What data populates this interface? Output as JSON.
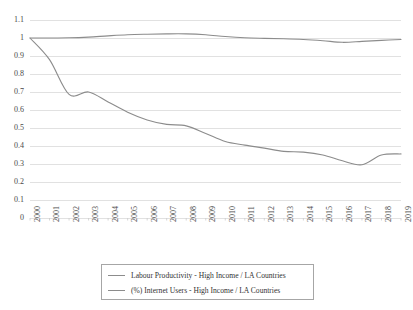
{
  "chart_data": {
    "type": "line",
    "title": "",
    "xlabel": "",
    "ylabel": "",
    "grid": "horizontal",
    "legend_position": "bottom",
    "ylim": [
      0,
      1.1
    ],
    "yticks": [
      "0",
      "0.1",
      "0.2",
      "0.3",
      "0.4",
      "0.5",
      "0.6",
      "0.7",
      "0.8",
      "0.9",
      "1",
      "1.1"
    ],
    "ytick_values": [
      0,
      0.1,
      0.2,
      0.3,
      0.4,
      0.5,
      0.6,
      0.7,
      0.8,
      0.9,
      1.0,
      1.1
    ],
    "x": [
      "2000",
      "2001",
      "2002",
      "2003",
      "2004",
      "2005",
      "2006",
      "2007",
      "2008",
      "2009",
      "2010",
      "2011",
      "2012",
      "2013",
      "2014",
      "2015",
      "2016",
      "2017",
      "2018",
      "2019"
    ],
    "series": [
      {
        "name": "Labour Productivity - High Income / LA Countries",
        "color": "#8c8c8c",
        "values": [
          1.0,
          1.0,
          1.001,
          1.005,
          1.012,
          1.018,
          1.021,
          1.023,
          1.023,
          1.018,
          1.008,
          1.001,
          0.998,
          0.996,
          0.992,
          0.985,
          0.976,
          0.981,
          0.987,
          0.992
        ]
      },
      {
        "name": "(%) Internet Users - High Income / LA Countries",
        "color": "#8c8c8c",
        "values": [
          1.0,
          0.88,
          0.687,
          0.7,
          0.645,
          0.588,
          0.545,
          0.52,
          0.512,
          0.47,
          0.425,
          0.405,
          0.388,
          0.37,
          0.366,
          0.35,
          0.318,
          0.296,
          0.35,
          0.356
        ]
      }
    ]
  },
  "legend": {
    "entries": [
      {
        "label": "Labour Productivity - High Income / LA Countries"
      },
      {
        "label": "(%) Internet Users - High Income / LA Countries"
      }
    ]
  }
}
